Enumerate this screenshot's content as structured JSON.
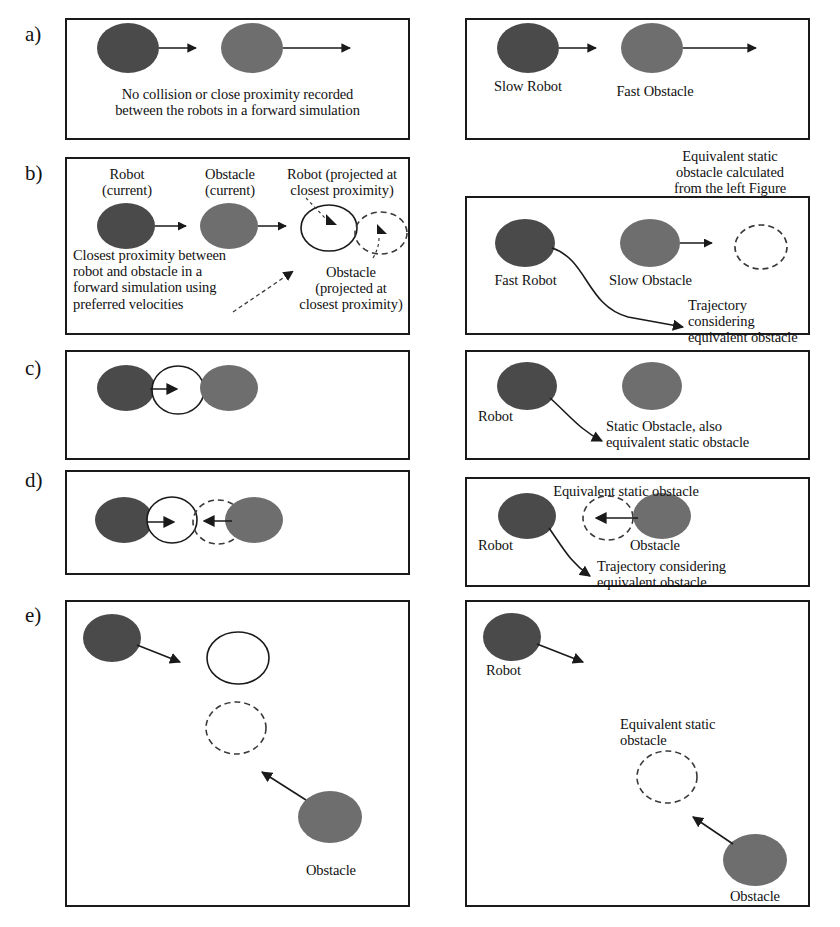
{
  "figure": {
    "background": "#ffffff",
    "line_color": "#1a1a1a",
    "robot_fill_dark": "#4a4a4a",
    "obstacle_fill_mid": "#6e6e6e",
    "projected_outline": "#1a1a1a",
    "dashed_outline": "#3a3a3a"
  },
  "rows": [
    {
      "id": "a",
      "label": "a)"
    },
    {
      "id": "b",
      "label": "b)"
    },
    {
      "id": "c",
      "label": "c)"
    },
    {
      "id": "d",
      "label": "d)"
    },
    {
      "id": "e",
      "label": "e)"
    }
  ],
  "panels": {
    "a_left": {
      "caption": "No collision or close proximity recorded\nbetween the robots in a forward simulation"
    },
    "a_right": {
      "robot_label": "Slow Robot",
      "obstacle_label": "Fast Obstacle"
    },
    "b_left": {
      "robot_current": "Robot\n(current)",
      "obstacle_current": "Obstacle\n(current)",
      "robot_projected": "Robot (projected at\nclosest proximity)",
      "closest_proximity_note": "Closest proximity between\nrobot and obstacle in a\nforward simulation using\npreferred velocities",
      "obstacle_projected": "Obstacle\n(projected at\nclosest proximity)"
    },
    "b_right": {
      "equivalent_note": "Equivalent static\nobstacle calculated\nfrom the left Figure",
      "robot_label": "Fast Robot",
      "obstacle_label": "Slow Obstacle",
      "trajectory_label": "Trajectory considering\nequivalent obstacle"
    },
    "c_left": {},
    "c_right": {
      "robot_label": "Robot",
      "obstacle_label": "Static Obstacle, also\nequivalent static obstacle"
    },
    "d_left": {},
    "d_right": {
      "equivalent_label": "Equivalent static obstacle",
      "robot_label": "Robot",
      "obstacle_label": "Obstacle",
      "trajectory_label": "Trajectory considering\nequivalent obstacle"
    },
    "e_left": {
      "obstacle_label": "Obstacle"
    },
    "e_right": {
      "robot_label": "Robot",
      "equivalent_label": "Equivalent static\nobstacle",
      "obstacle_label": "Obstacle"
    }
  }
}
